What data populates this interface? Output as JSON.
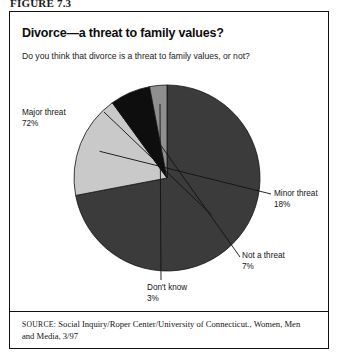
{
  "figure": {
    "number": "FIGURE 7.3",
    "title": "Divorce—a threat to family values?",
    "question": "Do you think that divorce is a threat to family values, or not?"
  },
  "source": {
    "label": "SOURCE:",
    "text": "Social Inquiry/Roper Center/University of Connecticut., Women, Men and Media, 3/97"
  },
  "labels": {
    "major": {
      "name": "Major threat",
      "pct": "72%"
    },
    "minor": {
      "name": "Minor threat",
      "pct": "18%"
    },
    "nota": {
      "name": "Not a threat",
      "pct": "7%"
    },
    "dontknow": {
      "name": "Don't know",
      "pct": "3%"
    }
  },
  "colors": {
    "major": "#3b3b3b",
    "minor": "#c9c9c9",
    "nota": "#0e0e0e",
    "dontknow": "#8f8f8f",
    "outline": "#111111",
    "leader": "#111111"
  },
  "chart_data": {
    "type": "pie",
    "title": "Divorce—a threat to family values?",
    "subtitle": "Do you think that divorce is a threat to family values, or not?",
    "categories": [
      "Major threat",
      "Minor threat",
      "Not a threat",
      "Don't know"
    ],
    "values": [
      72,
      18,
      7,
      3
    ],
    "unit": "percent",
    "labels": [
      "72%",
      "18%",
      "7%",
      "3%"
    ],
    "slice_colors": [
      "#3b3b3b",
      "#c9c9c9",
      "#0e0e0e",
      "#8f8f8f"
    ],
    "start_angle_deg": 0,
    "direction": "clockwise",
    "legend": "none",
    "annotations": "leader lines from each slice to an external text label",
    "center_px": [
      158,
      167
    ],
    "radius_px": 93
  }
}
